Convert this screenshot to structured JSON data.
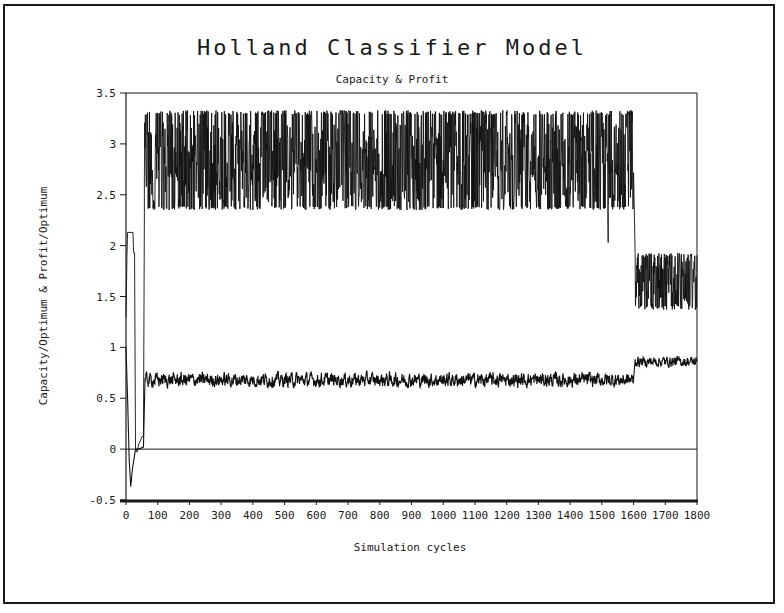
{
  "chart_data": {
    "type": "line",
    "title": "Holland Classifier Model",
    "subtitle": "Capacity & Profit",
    "xlabel": "Simulation cycles",
    "ylabel": "Capacity/Optimum & Profit/Optimum",
    "xlim": [
      0,
      1800
    ],
    "ylim": [
      -0.5,
      3.5
    ],
    "x_ticks": [
      0,
      100,
      200,
      300,
      400,
      500,
      600,
      700,
      800,
      900,
      1000,
      1100,
      1200,
      1300,
      1400,
      1500,
      1600,
      1700,
      1800
    ],
    "y_ticks": [
      -0.5,
      0,
      0.5,
      1,
      1.5,
      2,
      2.5,
      3,
      3.5
    ],
    "y_tick_labels": [
      "-0.5",
      "0",
      "0.5",
      "1",
      "1.5",
      "2",
      "2.5",
      "3",
      "3.5"
    ],
    "grid": false,
    "reference_lines": [
      {
        "y": 0
      }
    ],
    "legend": null,
    "series": [
      {
        "name": "Capacity/Optimum",
        "description": "Noisy series oscillating between band limits",
        "initial_points": [
          [
            0,
            1.3
          ],
          [
            3,
            1.9
          ],
          [
            5,
            2.13
          ],
          [
            22,
            2.13
          ],
          [
            24,
            1.93
          ],
          [
            27,
            1.93
          ],
          [
            30,
            0.0
          ],
          [
            35,
            -0.03
          ],
          [
            40,
            0.05
          ],
          [
            45,
            0.08
          ],
          [
            50,
            0.12
          ],
          [
            55,
            0.13
          ],
          [
            58,
            2.35
          ]
        ],
        "segments": [
          {
            "from": 58,
            "to": 1600,
            "min": 2.35,
            "max": 3.33,
            "mean": 2.82
          },
          {
            "from": 1605,
            "to": 1800,
            "min": 1.37,
            "max": 1.93,
            "mean": 1.63
          }
        ],
        "notable_points": [
          [
            1520,
            2.03
          ]
        ]
      },
      {
        "name": "Profit/Optimum",
        "description": "Noisy series with small variance",
        "initial_points": [
          [
            0,
            1.0
          ],
          [
            5,
            0.5
          ],
          [
            10,
            -0.1
          ],
          [
            15,
            -0.37
          ],
          [
            20,
            -0.2
          ],
          [
            25,
            -0.1
          ],
          [
            30,
            0.0
          ],
          [
            40,
            0.0
          ],
          [
            55,
            0.02
          ],
          [
            60,
            0.7
          ]
        ],
        "segments": [
          {
            "from": 60,
            "to": 1600,
            "min": 0.58,
            "max": 0.79,
            "mean": 0.68
          },
          {
            "from": 1605,
            "to": 1800,
            "min": 0.78,
            "max": 0.93,
            "mean": 0.86
          }
        ]
      }
    ]
  }
}
